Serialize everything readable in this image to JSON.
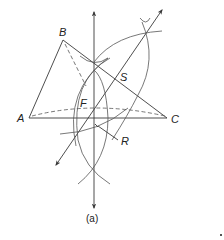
{
  "figure": {
    "caption": "(a)",
    "points": {
      "A": {
        "label": "A",
        "x": 29,
        "y": 118
      },
      "B": {
        "label": "B",
        "x": 63,
        "y": 40
      },
      "C": {
        "label": "C",
        "x": 167,
        "y": 118
      },
      "F": {
        "label": "F"
      },
      "S": {
        "label": "S"
      },
      "R": {
        "label": "R"
      }
    },
    "colors": {
      "stroke": "#3a3a3a",
      "background": "#ffffff"
    }
  }
}
